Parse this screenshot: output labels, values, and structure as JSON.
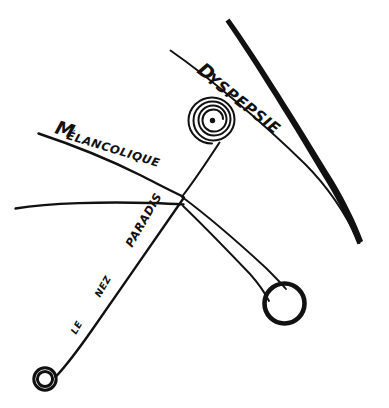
{
  "figure": {
    "medium": "pen and ink line drawing",
    "background_color": "#ffffff",
    "ink_color": "#111111",
    "labels": [
      {
        "id": "dyspepsie",
        "text": "DYSPEPSIE",
        "initial": "D",
        "rest": "YSPEPSIE",
        "style": "handwritten-capitals",
        "rotation_deg": 38,
        "x": 196,
        "y": 72
      },
      {
        "id": "melancolique",
        "text": "Mélancolique",
        "initial": "M",
        "rest": "ÉLANCOLIQUE",
        "style": "handwritten-mixed",
        "rotation_deg": 17,
        "x": 54,
        "y": 133
      },
      {
        "id": "paradis",
        "text": "PARADIS",
        "style": "handwritten-capitals",
        "rotation_deg": -60,
        "x": 132,
        "y": 248
      },
      {
        "id": "nez",
        "text": "NEZ",
        "style": "handwritten-capitals",
        "rotation_deg": -60,
        "x": 100,
        "y": 298
      },
      {
        "id": "le",
        "text": "LE",
        "style": "handwritten-capitals",
        "rotation_deg": -60,
        "x": 76,
        "y": 335
      }
    ],
    "phrase_bottom_left": "LE NEZ PARADIS",
    "shapes": [
      {
        "id": "spiral",
        "kind": "spiral",
        "turns": 4,
        "center_x": 212,
        "center_y": 121,
        "outer_radius": 23
      },
      {
        "id": "center-dot",
        "kind": "dot",
        "center_x": 212,
        "center_y": 121,
        "radius": 2.6
      },
      {
        "id": "right-circle",
        "kind": "ring",
        "center_x": 284,
        "center_y": 303,
        "radius": 20
      },
      {
        "id": "bottom-left-circle",
        "kind": "double-ring",
        "center_x": 45,
        "center_y": 379,
        "radius": 11
      },
      {
        "id": "heavy-stroke",
        "kind": "thick-curve",
        "description": "heavy tapering brush stroke upper right"
      },
      {
        "id": "thin-diagonal",
        "kind": "line",
        "description": "thin diagonal under heavy stroke"
      },
      {
        "id": "hub",
        "kind": "junction",
        "x": 182,
        "y": 196
      },
      {
        "id": "tube",
        "kind": "tapering-tube",
        "from": "hub",
        "to": "right-circle"
      },
      {
        "id": "horizontal-line",
        "kind": "line",
        "description": "near horizontal line from left edge to hub"
      },
      {
        "id": "stem",
        "kind": "line",
        "description": "line from spiral down to hub"
      },
      {
        "id": "pin-line",
        "kind": "line",
        "description": "long diagonal from hub to bottom-left circle"
      }
    ]
  }
}
